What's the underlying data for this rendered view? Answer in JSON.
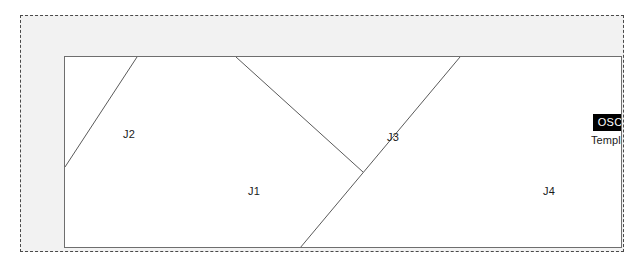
{
  "diagram": {
    "outer_frame": {
      "style": "dashed",
      "border_color": "#4a4a4a",
      "fill_color": "#f2f2f2"
    },
    "template_rect": {
      "border_color": "#6e6e6e",
      "fill_color": "#ffffff"
    },
    "line_color": "#5a5a5a",
    "regions": [
      {
        "id": "J1",
        "label": "J1"
      },
      {
        "id": "J2",
        "label": "J2"
      },
      {
        "id": "J3",
        "label": "J3"
      },
      {
        "id": "J4",
        "label": "J4"
      }
    ],
    "partition_lines": [
      {
        "name": "j2-divider",
        "x1": 0,
        "y1": 110,
        "x2": 72,
        "y2": 0
      },
      {
        "name": "j3-left-divider",
        "x1": 171,
        "y1": 0,
        "x2": 298,
        "y2": 115
      },
      {
        "name": "j4-divider",
        "x1": 235,
        "y1": 191,
        "x2": 395,
        "y2": 0
      }
    ]
  },
  "badge": {
    "brand_label": "OSCAR",
    "brand_bg_color": "#000000",
    "brand_text_color": "#ffffff",
    "template_label": "Template J"
  }
}
